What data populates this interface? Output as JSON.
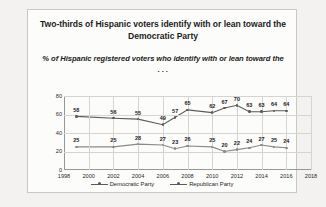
{
  "title": "Two-thirds of Hispanic voters identify with or lean toward the Democratic Party",
  "subtitle": "% of Hispanic registered voters who identify with or lean toward the . . .",
  "legend": {
    "democratic": "Democratic Party",
    "republican": "Republican Party"
  },
  "chart_data": {
    "type": "line",
    "title": "Two-thirds of Hispanic voters identify with or lean toward the Democratic Party",
    "subtitle": "% of Hispanic registered voters who identify with or lean toward the . . .",
    "xlabel": "",
    "ylabel": "",
    "xlim": [
      1998,
      2018
    ],
    "ylim": [
      0,
      80
    ],
    "yticks": [
      0,
      20,
      40,
      60,
      80
    ],
    "xticks": [
      1998,
      2000,
      2002,
      2004,
      2006,
      2008,
      2010,
      2012,
      2014,
      2016,
      2018
    ],
    "grid": true,
    "legend_position": "bottom",
    "x": [
      1999,
      2002,
      2004,
      2006,
      2007,
      2008,
      2010,
      2011,
      2012,
      2013,
      2014,
      2015,
      2016
    ],
    "series": [
      {
        "name": "Democratic Party",
        "color": "#5b5b5b",
        "values": [
          58,
          56,
          55,
          49,
          57,
          65,
          62,
          67,
          70,
          63,
          63,
          64,
          64
        ]
      },
      {
        "name": "Republican Party",
        "color": "#8a8a8a",
        "values": [
          25,
          25,
          28,
          27,
          23,
          26,
          25,
          20,
          22,
          24,
          27,
          25,
          24
        ]
      }
    ]
  }
}
